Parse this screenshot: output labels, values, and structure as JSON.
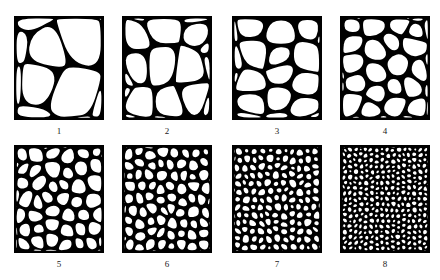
{
  "figure": {
    "kind": "grain-size-comparison-chart",
    "background_color": "#ffffff",
    "line_color": "#000000",
    "label_color": "#1a1a1a",
    "rows": 2,
    "columns": 4
  },
  "panels": [
    {
      "label": "1",
      "x": 14,
      "y": 16,
      "width": 90,
      "height": 104,
      "grain_count": 8,
      "cell_size": 46,
      "line_width": 2.6,
      "seed": 11,
      "jitter": 0.34,
      "roundness": 0.05
    },
    {
      "label": "2",
      "x": 122,
      "y": 16,
      "width": 90,
      "height": 104,
      "grain_count": 15,
      "cell_size": 33,
      "line_width": 2.5,
      "seed": 22,
      "jitter": 0.33,
      "roundness": 0.12
    },
    {
      "label": "3",
      "x": 232,
      "y": 16,
      "width": 90,
      "height": 104,
      "grain_count": 20,
      "cell_size": 28,
      "line_width": 2.5,
      "seed": 33,
      "jitter": 0.32,
      "roundness": 0.16
    },
    {
      "label": "4",
      "x": 340,
      "y": 16,
      "width": 90,
      "height": 104,
      "grain_count": 30,
      "cell_size": 22,
      "line_width": 2.4,
      "seed": 44,
      "jitter": 0.31,
      "roundness": 0.22
    },
    {
      "label": "5",
      "x": 14,
      "y": 145,
      "width": 90,
      "height": 108,
      "grain_count": 55,
      "cell_size": 16,
      "line_width": 2.3,
      "seed": 55,
      "jitter": 0.3,
      "roundness": 0.3
    },
    {
      "label": "6",
      "x": 122,
      "y": 145,
      "width": 90,
      "height": 108,
      "grain_count": 90,
      "cell_size": 12,
      "line_width": 2.2,
      "seed": 66,
      "jitter": 0.29,
      "roundness": 0.36
    },
    {
      "label": "7",
      "x": 232,
      "y": 145,
      "width": 90,
      "height": 108,
      "grain_count": 170,
      "cell_size": 8.5,
      "line_width": 2.1,
      "seed": 77,
      "jitter": 0.28,
      "roundness": 0.42
    },
    {
      "label": "8",
      "x": 340,
      "y": 145,
      "width": 90,
      "height": 108,
      "grain_count": 340,
      "cell_size": 5.8,
      "line_width": 1.9,
      "seed": 88,
      "jitter": 0.27,
      "roundness": 0.46
    }
  ],
  "labels": {
    "row1": [
      "1",
      "2",
      "3",
      "4"
    ],
    "row2": [
      "5",
      "6",
      "7",
      "8"
    ]
  }
}
